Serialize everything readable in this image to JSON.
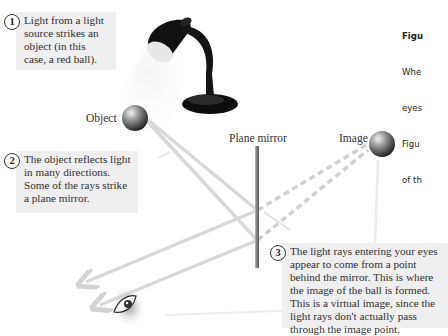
{
  "caption": {
    "title": "Figu",
    "lines": [
      "Whe",
      "eyes",
      "Figu",
      "of th"
    ]
  },
  "callouts": [
    {
      "number": "1",
      "lines": "Light from a light\nsource strikes an\nobject (in this\ncase, a red ball)."
    },
    {
      "number": "2",
      "lines": "The object reflects light\nin many directions.\nSome of the rays strike\na plane mirror."
    },
    {
      "number": "3",
      "lines": "The light rays entering your eyes\nappear to come from a point\nbehind the mirror. This is where\nthe image of the ball is formed.\nThis is a virtual image, since the\nlight rays don't actually pass\nthrough the image point."
    }
  ],
  "labels": {
    "object": "Object",
    "mirror": "Plane mirror",
    "image": "Image"
  },
  "icons": [
    "desk-lamp-icon",
    "ball-object-icon",
    "ball-image-icon",
    "mirror-icon",
    "eye-icon"
  ],
  "colors": {
    "callout_bg": "#efefef",
    "ray": "#d6d6d6",
    "mirror": "#8a8a8a",
    "lamp": "#111111"
  }
}
